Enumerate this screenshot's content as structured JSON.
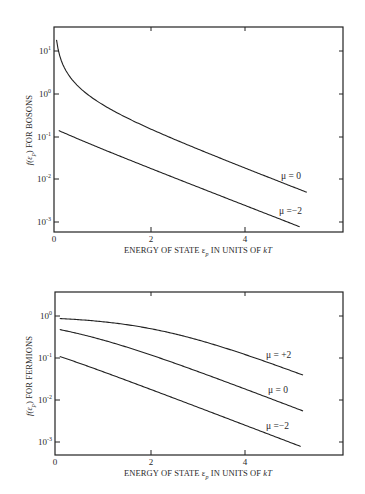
{
  "chart_data": [
    {
      "type": "line",
      "title": "",
      "xlabel": "ENERGY OF STATE εp IN UNITS OF kT",
      "ylabel": "f(εp) FOR BOSONS",
      "yscale": "log",
      "xlim": [
        0,
        6.05
      ],
      "ylim": [
        0.0007,
        40
      ],
      "x_ticks": [
        0,
        2,
        4
      ],
      "x_tick_labels": [
        "0",
        "2",
        "4"
      ],
      "y_ticks": [
        10,
        1,
        0.1,
        0.01,
        0.001
      ],
      "y_tick_labels": [
        "10^1",
        "10^0",
        "10^-1",
        "10^-2",
        "10^-3"
      ],
      "grid": false,
      "legend": "inline labels near curve ends",
      "formula": "f = 1/(exp(ε−μ) − 1)",
      "x": [
        0.1,
        0.5,
        1,
        1.5,
        2,
        2.5,
        3,
        3.5,
        4,
        4.5,
        5,
        5.2
      ],
      "series": [
        {
          "name": "μ = 0",
          "mu": 0,
          "x_start": 0.02,
          "x_end": 5.3,
          "values": [
            9.51,
            1.54,
            0.582,
            0.287,
            0.157,
            0.0894,
            0.0524,
            0.0311,
            0.0187,
            0.0112,
            0.00678,
            0.00554
          ]
        },
        {
          "name": "μ = −2",
          "mu": -2,
          "x_start": 0.1,
          "x_end": 5.15,
          "values": [
            0.1504,
            0.0828,
            0.0524,
            0.0311,
            0.0187,
            0.0112,
            0.00678,
            0.0041,
            0.00248,
            0.0015,
            0.00091,
            0.00075
          ]
        }
      ]
    },
    {
      "type": "line",
      "title": "",
      "xlabel": "ENERGY OF STATE εp IN UNITS OF kT",
      "ylabel": "f(εp) FOR FERMIONS",
      "yscale": "log",
      "xlim": [
        0,
        6.05
      ],
      "ylim": [
        0.0005,
        3
      ],
      "x_ticks": [
        0,
        2,
        4
      ],
      "x_tick_labels": [
        "0",
        "2",
        "4"
      ],
      "y_ticks": [
        1,
        0.1,
        0.01,
        0.001
      ],
      "y_tick_labels": [
        "10^0",
        "10^-1",
        "10^-2",
        "10^-3"
      ],
      "grid": false,
      "legend": "inline labels near curve ends",
      "formula": "f = 1/(exp(ε−μ) + 1)",
      "x": [
        0.1,
        0.5,
        1,
        1.5,
        2,
        2.5,
        3,
        3.5,
        4,
        4.5,
        5,
        5.2
      ],
      "series": [
        {
          "name": "μ = +2",
          "mu": 2,
          "x_start": 0.1,
          "x_end": 5.2,
          "values": [
            0.87,
            0.818,
            0.731,
            0.622,
            0.5,
            0.378,
            0.269,
            0.182,
            0.119,
            0.0759,
            0.0474,
            0.0392
          ]
        },
        {
          "name": "μ = 0",
          "mu": 0,
          "x_start": 0.1,
          "x_end": 5.2,
          "values": [
            0.475,
            0.378,
            0.269,
            0.182,
            0.119,
            0.0759,
            0.0474,
            0.0293,
            0.018,
            0.011,
            0.00669,
            0.00549
          ]
        },
        {
          "name": "μ = −2",
          "mu": -2,
          "x_start": 0.1,
          "x_end": 5.15,
          "values": [
            0.109,
            0.0759,
            0.0474,
            0.0293,
            0.018,
            0.011,
            0.00669,
            0.00407,
            0.00247,
            0.0015,
            0.00091,
            0.00075
          ]
        }
      ]
    }
  ],
  "bosons": {
    "ylabel_prefix": "f(ε",
    "ylabel_sub": "p",
    "ylabel_suffix": ") FOR BOSONS",
    "y_ticks": [
      {
        "base": "10",
        "exp": "1"
      },
      {
        "base": "10",
        "exp": "0"
      },
      {
        "base": "10",
        "exp": "-1"
      },
      {
        "base": "10",
        "exp": "-2"
      },
      {
        "base": "10",
        "exp": "-3"
      }
    ],
    "x_tick_labels": [
      "0",
      "2",
      "4"
    ],
    "xlabel_main": "ENERGY OF STATE ε",
    "xlabel_sub": "p",
    "xlabel_rest": " IN UNITS OF ",
    "xlabel_kt": "kT",
    "curve_labels": [
      "μ = 0",
      "μ =−2"
    ]
  },
  "fermions": {
    "ylabel_prefix": "f(ε",
    "ylabel_sub": "p",
    "ylabel_suffix": ") FOR FERMIONS",
    "y_ticks": [
      {
        "base": "10",
        "exp": "0"
      },
      {
        "base": "10",
        "exp": "-1"
      },
      {
        "base": "10",
        "exp": "-2"
      },
      {
        "base": "10",
        "exp": "-3"
      }
    ],
    "x_tick_labels": [
      "0",
      "2",
      "4"
    ],
    "xlabel_main": "ENERGY OF STATE ε",
    "xlabel_sub": "p",
    "xlabel_rest": " IN UNITS OF ",
    "xlabel_kt": "kT",
    "curve_labels": [
      "μ = +2",
      "μ = 0",
      "μ =−2"
    ]
  }
}
